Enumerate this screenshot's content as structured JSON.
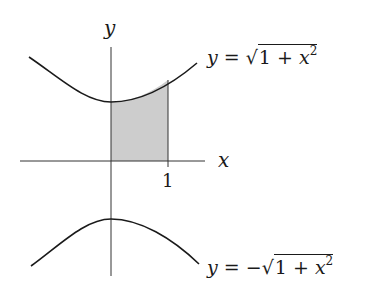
{
  "figure": {
    "axes": {
      "x_label": "x",
      "y_label": "y",
      "tick_label": "1"
    },
    "upper_curve": {
      "label_lhs": "y =",
      "label_sign": "",
      "radicand_1": "1 + ",
      "radicand_x": "x",
      "radicand_exp": "2"
    },
    "lower_curve": {
      "label_lhs": "y =",
      "label_sign": "−",
      "radicand_1": "1 + ",
      "radicand_x": "x",
      "radicand_exp": "2"
    },
    "shaded_region": {
      "from_x": 0,
      "to_x": 1,
      "fill": "#c8c8c8"
    },
    "colors": {
      "curve": "#1a1a1a",
      "axis": "#333333",
      "shade": "#cfcfcf"
    }
  }
}
